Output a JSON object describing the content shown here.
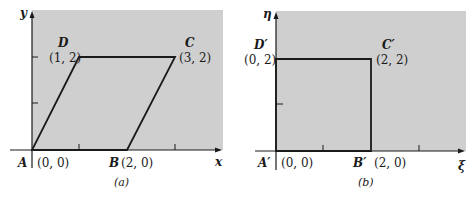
{
  "figure_a": {
    "caption": "(a)",
    "x_axis_label": "x",
    "y_axis_label": "y",
    "vertices": [
      {
        "name": "A",
        "coord": "(0, 0)",
        "x": 0,
        "y": 0
      },
      {
        "name": "B",
        "coord": "(2, 0)",
        "x": 2,
        "y": 0
      },
      {
        "name": "C",
        "coord": "(3, 2)",
        "x": 3,
        "y": 2
      },
      {
        "name": "D",
        "coord": "(1, 2)",
        "x": 1,
        "y": 2
      }
    ],
    "shape": "parallelogram"
  },
  "figure_b": {
    "caption": "(b)",
    "x_axis_label": "ξ",
    "y_axis_label": "η",
    "vertices": [
      {
        "name": "A′",
        "coord": "(0, 0)",
        "x": 0,
        "y": 0
      },
      {
        "name": "B′",
        "coord": "(2, 0)",
        "x": 2,
        "y": 0
      },
      {
        "name": "C′",
        "coord": "(2, 2)",
        "x": 2,
        "y": 2
      },
      {
        "name": "D′",
        "coord": "(0, 2)",
        "x": 0,
        "y": 2
      }
    ],
    "shape": "square"
  },
  "colors": {
    "panel_fill": "#cfcfcf",
    "line": "#1a1a1a"
  }
}
